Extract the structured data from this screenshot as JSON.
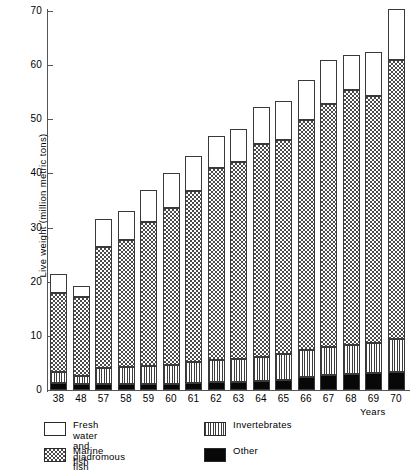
{
  "chart_data": {
    "type": "bar",
    "subtype": "stacked-bar",
    "title": "",
    "xlabel": "Years",
    "ylabel": "Live weight (million metric tons)",
    "ylim": [
      0,
      70
    ],
    "yticks": [
      0,
      10,
      20,
      30,
      40,
      50,
      60,
      70
    ],
    "ytick_labels": [
      "0",
      "10",
      "20",
      "30",
      "40",
      "50",
      "60",
      "70"
    ],
    "grid": false,
    "legend_position": "below-axes",
    "categories": [
      "38",
      "48",
      "57",
      "58",
      "59",
      "60",
      "61",
      "62",
      "63",
      "64",
      "65",
      "66",
      "67",
      "68",
      "69",
      "70"
    ],
    "stack_order_bottom_to_top": [
      "Other",
      "Invertebrates",
      "Marine fish",
      "Fresh water and diadromous fish"
    ],
    "series": [
      {
        "name": "Other",
        "pattern": "solid-black",
        "color": "#080808",
        "values": [
          1.2,
          1.0,
          1.0,
          1.0,
          1.0,
          1.0,
          1.2,
          1.3,
          1.3,
          1.5,
          1.6,
          2.2,
          2.5,
          2.7,
          2.9,
          3.2
        ]
      },
      {
        "name": "Invertebrates",
        "pattern": "vertical-lines",
        "color": "#3d3d3d",
        "values": [
          2.0,
          1.4,
          2.9,
          3.1,
          3.3,
          3.5,
          3.8,
          4.0,
          4.2,
          4.5,
          4.8,
          5.0,
          5.2,
          5.4,
          5.6,
          6.0
        ]
      },
      {
        "name": "Marine fish",
        "pattern": "stipple-dots",
        "color": "#4a4a4a",
        "values": [
          14.6,
          14.6,
          22.3,
          23.4,
          26.5,
          29.0,
          31.5,
          35.5,
          36.5,
          39.2,
          39.6,
          42.4,
          45.0,
          47.1,
          45.7,
          51.6
        ]
      },
      {
        "name": "Fresh water and diadromous fish",
        "pattern": "blank-white",
        "color": "#ffffff",
        "values": [
          3.7,
          2.2,
          5.3,
          5.5,
          6.2,
          6.5,
          6.8,
          6.2,
          6.2,
          7.0,
          7.3,
          7.6,
          8.3,
          6.6,
          8.2,
          9.6
        ]
      }
    ],
    "totals": [
      21.5,
      19.2,
      31.5,
      33.0,
      37.0,
      40.0,
      43.3,
      47.0,
      48.2,
      52.2,
      53.3,
      57.2,
      61.0,
      61.8,
      62.4,
      70.4
    ]
  },
  "legend": {
    "entries": [
      {
        "label": "Fresh water\nand diadromous fish",
        "pattern": "blank-white"
      },
      {
        "label": "Invertebrates",
        "pattern": "vertical-lines"
      },
      {
        "label": "Marine fish",
        "pattern": "stipple-dots"
      },
      {
        "label": "Other",
        "pattern": "solid-black"
      }
    ]
  }
}
